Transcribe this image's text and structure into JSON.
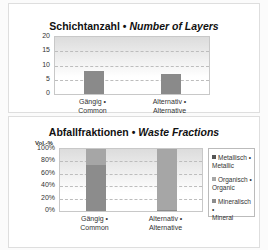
{
  "chart_data": [
    {
      "type": "bar",
      "title": "Schichtanzahl • Number of Layers",
      "title_de": "Schichtanzahl",
      "title_en": "Number of Layers",
      "categories": [
        "Gängig • Common",
        "Alternativ • Alternative"
      ],
      "category_lines": [
        [
          "Gängig •",
          "Common"
        ],
        [
          "Alternativ •",
          "Alternative"
        ]
      ],
      "values": [
        8,
        7
      ],
      "xlabel": "",
      "ylabel": "",
      "ylim": [
        0,
        20
      ],
      "yticks": [
        "20",
        "15",
        "10",
        "5",
        "0"
      ],
      "grid": true,
      "bar_color": "#8a8a8a"
    },
    {
      "type": "bar",
      "stacked": true,
      "title": "Abfallfraktionen • Waste Fractions",
      "title_de": "Abfallfraktionen",
      "title_en": "Waste Fractions",
      "ylabel": "Vol.-%",
      "categories": [
        "Gängig • Common",
        "Alternativ • Alternative"
      ],
      "category_lines": [
        [
          "Gängig •",
          "Common"
        ],
        [
          "Alternativ •",
          "Alternative"
        ]
      ],
      "ylim": [
        0,
        100
      ],
      "yticks": [
        "100%",
        "80%",
        "60%",
        "40%",
        "20%",
        "0%"
      ],
      "grid": true,
      "legend_position": "right",
      "series": [
        {
          "name": "Mineralisch • Mineral",
          "lines": [
            "Mineralisch •",
            "Mineral"
          ],
          "values": [
            75,
            2
          ],
          "color": "#8c8c8c"
        },
        {
          "name": "Organisch • Organic",
          "lines": [
            "Organisch •",
            "Organic"
          ],
          "values": [
            25,
            98
          ],
          "color": "#a6a6a6"
        },
        {
          "name": "Metallisch • Metallic",
          "lines": [
            "Metallisch •",
            "Metallic"
          ],
          "values": [
            0,
            0
          ],
          "color": "#555555"
        }
      ],
      "legend_order": [
        "Metallisch • Metallic",
        "Organisch • Organic",
        "Mineralisch • Mineral"
      ]
    }
  ]
}
